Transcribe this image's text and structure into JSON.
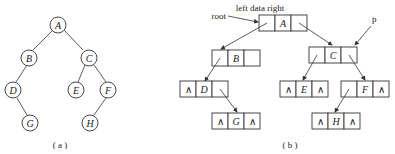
{
  "figure_a": {
    "caption": "( a )",
    "nodes": [
      {
        "id": "A",
        "label": "A"
      },
      {
        "id": "B",
        "label": "B"
      },
      {
        "id": "C",
        "label": "C"
      },
      {
        "id": "D",
        "label": "D"
      },
      {
        "id": "E",
        "label": "E"
      },
      {
        "id": "F",
        "label": "F"
      },
      {
        "id": "G",
        "label": "G"
      },
      {
        "id": "H",
        "label": "H"
      }
    ],
    "edges": [
      [
        "A",
        "B"
      ],
      [
        "A",
        "C"
      ],
      [
        "B",
        "D"
      ],
      [
        "C",
        "E"
      ],
      [
        "C",
        "F"
      ],
      [
        "D",
        "G"
      ],
      [
        "F",
        "H"
      ]
    ]
  },
  "figure_b": {
    "caption": "( b )",
    "header": "left data right",
    "root_label": "root",
    "p_label": "p",
    "null_symbol": "∧",
    "nodes": {
      "A": {
        "data": "A"
      },
      "B": {
        "data": "B"
      },
      "C": {
        "data": "C"
      },
      "D": {
        "data": "D"
      },
      "E": {
        "data": "E"
      },
      "F": {
        "data": "F"
      },
      "G": {
        "data": "G"
      },
      "H": {
        "data": "H"
      }
    }
  }
}
